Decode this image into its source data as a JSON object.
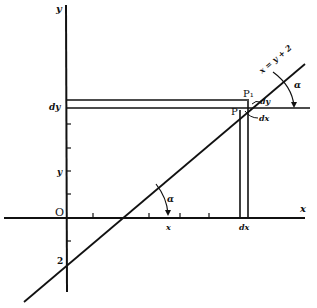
{
  "diagram": {
    "axes": {
      "y_label": "y",
      "x_label": "x",
      "origin_label": "O"
    },
    "line": {
      "equation_label": "x = y + 2",
      "y_intercept_label": "2"
    },
    "points": {
      "p_label": "P",
      "p1_label": "P₁"
    },
    "labels": {
      "y_axis_marker_top": "dy",
      "y_axis_marker_mid": "y",
      "x_axis_marker_x": "x",
      "x_axis_marker_dx": "dx",
      "increment_dy": "dy",
      "increment_dx": "dx",
      "angle_upper": "α",
      "angle_lower": "α"
    },
    "colors": {
      "stroke": "#111111",
      "background": "#ffffff"
    }
  }
}
